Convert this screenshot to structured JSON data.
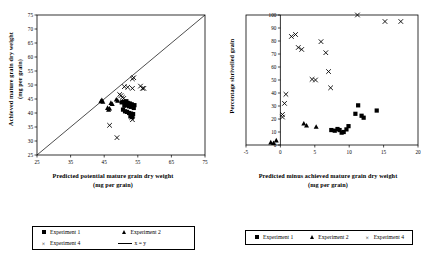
{
  "figure": {
    "background": "#ffffff",
    "ink": "#000000"
  },
  "panels": [
    {
      "id": "left",
      "xlabel_line1": "Predicted potential mature grain dry weight",
      "xlabel_line2": "(mg per grain)",
      "ylabel_line1": "Achieved mature grain dry weight",
      "ylabel_line2": "(mg per grain)",
      "xticks": [
        25,
        35,
        45,
        55,
        65,
        75
      ],
      "yticks": [
        25,
        30,
        35,
        40,
        45,
        50,
        55,
        60,
        65,
        70,
        75
      ],
      "xlim": [
        25,
        75
      ],
      "ylim": [
        25,
        75
      ]
    },
    {
      "id": "right",
      "xlabel_line1": "Predicted minus achieved mature grain dry weight",
      "xlabel_line2": "(mg per grain)",
      "ylabel_line1": "Percentage shrivelled grain",
      "xticks": [
        -5,
        0,
        5,
        10,
        15,
        20
      ],
      "yticks": [
        0,
        10,
        20,
        30,
        40,
        50,
        60,
        70,
        80,
        90,
        100
      ],
      "xlim": [
        -5,
        20
      ],
      "ylim": [
        0,
        100
      ]
    }
  ],
  "legends": {
    "left": {
      "entries": [
        {
          "label": "Experiment 1",
          "marker": "square"
        },
        {
          "label": "Experiment 2",
          "marker": "triangle"
        },
        {
          "label": "Experiment 4",
          "marker": "cross",
          "glyph": "×"
        },
        {
          "label": "x = y",
          "marker": "line"
        }
      ]
    },
    "right": {
      "entries": [
        {
          "label": "Experiment 1",
          "marker": "square"
        },
        {
          "label": "Experiment 2",
          "marker": "triangle"
        },
        {
          "label": "Experiment 4",
          "marker": "cross",
          "glyph": "×"
        }
      ]
    }
  },
  "chart_data": [
    {
      "type": "scatter",
      "panel": "left",
      "title": "",
      "xlabel": "Predicted potential mature grain dry weight (mg per grain)",
      "ylabel": "Achieved mature grain dry weight (mg per grain)",
      "xlim": [
        25,
        75
      ],
      "ylim": [
        25,
        75
      ],
      "xticks": [
        25,
        35,
        45,
        55,
        65,
        75
      ],
      "yticks": [
        25,
        30,
        35,
        40,
        45,
        50,
        55,
        60,
        65,
        70,
        75
      ],
      "grid": false,
      "legend_position": "below-figure",
      "reference_line": {
        "name": "x = y",
        "from": [
          25,
          25
        ],
        "to": [
          75,
          75
        ]
      },
      "series": [
        {
          "name": "Experiment 1",
          "marker": "square",
          "points": [
            [
              51.6,
              44.2
            ],
            [
              52.0,
              43.6
            ],
            [
              52.3,
              43.2
            ],
            [
              52.6,
              43.4
            ],
            [
              52.9,
              42.9
            ],
            [
              53.2,
              43.1
            ],
            [
              53.4,
              42.6
            ],
            [
              53.0,
              42.2
            ],
            [
              52.4,
              42.4
            ],
            [
              51.9,
              42.8
            ],
            [
              51.4,
              43.0
            ],
            [
              51.0,
              42.6
            ],
            [
              50.6,
              41.2
            ],
            [
              51.2,
              40.6
            ],
            [
              51.8,
              40.4
            ],
            [
              52.4,
              40.0
            ],
            [
              53.0,
              39.8
            ],
            [
              53.6,
              39.6
            ],
            [
              52.8,
              38.8
            ],
            [
              53.4,
              38.6
            ],
            [
              50.2,
              43.8
            ],
            [
              54.0,
              42.8
            ],
            [
              53.8,
              41.8
            ],
            [
              50.8,
              44.0
            ]
          ]
        },
        {
          "name": "Experiment 2",
          "marker": "triangle",
          "points": [
            [
              44.0,
              44.2
            ],
            [
              44.3,
              44.6
            ],
            [
              44.6,
              44.0
            ],
            [
              46.0,
              41.8
            ],
            [
              46.3,
              41.2
            ],
            [
              46.6,
              41.6
            ],
            [
              48.6,
              44.8
            ],
            [
              49.0,
              44.4
            ],
            [
              47.4,
              43.2
            ],
            [
              47.0,
              43.6
            ]
          ]
        },
        {
          "name": "Experiment 4",
          "marker": "cross",
          "points": [
            [
              53.8,
              52.6
            ],
            [
              53.4,
              52.2
            ],
            [
              51.0,
              49.4
            ],
            [
              52.0,
              49.2
            ],
            [
              53.4,
              48.8
            ],
            [
              55.8,
              49.6
            ],
            [
              56.4,
              48.8
            ],
            [
              56.8,
              48.8
            ],
            [
              49.6,
              46.6
            ],
            [
              50.0,
              46.2
            ],
            [
              50.4,
              45.6
            ],
            [
              50.8,
              45.2
            ],
            [
              53.2,
              38.4
            ],
            [
              53.4,
              37.6
            ],
            [
              46.6,
              35.6
            ],
            [
              48.8,
              31.2
            ]
          ]
        }
      ]
    },
    {
      "type": "scatter",
      "panel": "right",
      "title": "",
      "xlabel": "Predicted minus achieved mature grain dry weight (mg per grain)",
      "ylabel": "Percentage shrivelled grain",
      "xlim": [
        -5,
        20
      ],
      "ylim": [
        0,
        100
      ],
      "xticks": [
        -5,
        0,
        5,
        10,
        15,
        20
      ],
      "yticks": [
        0,
        10,
        20,
        30,
        40,
        50,
        60,
        70,
        80,
        90,
        100
      ],
      "grid": false,
      "legend_position": "below-figure",
      "series": [
        {
          "name": "Experiment 1",
          "marker": "square",
          "points": [
            [
              7.4,
              11.5
            ],
            [
              7.9,
              11.0
            ],
            [
              8.3,
              12.3
            ],
            [
              8.6,
              11.5
            ],
            [
              8.9,
              9.5
            ],
            [
              9.2,
              10.0
            ],
            [
              9.6,
              12.0
            ],
            [
              9.9,
              14.5
            ],
            [
              10.9,
              24.0
            ],
            [
              11.3,
              30.5
            ],
            [
              11.8,
              22.5
            ],
            [
              12.1,
              21.0
            ],
            [
              14.0,
              26.5
            ]
          ]
        },
        {
          "name": "Experiment 2",
          "marker": "triangle",
          "points": [
            [
              -1.4,
              2.0
            ],
            [
              -1.0,
              1.5
            ],
            [
              -0.6,
              3.5
            ],
            [
              3.4,
              16.5
            ],
            [
              3.8,
              15.0
            ],
            [
              5.2,
              14.0
            ]
          ]
        },
        {
          "name": "Experiment 4",
          "marker": "cross",
          "points": [
            [
              0.6,
              32.0
            ],
            [
              0.8,
              39.0
            ],
            [
              0.3,
              21.5
            ],
            [
              0.3,
              23.5
            ],
            [
              1.6,
              83.5
            ],
            [
              2.2,
              85.0
            ],
            [
              2.6,
              75.0
            ],
            [
              3.1,
              73.5
            ],
            [
              4.6,
              50.5
            ],
            [
              5.1,
              50.0
            ],
            [
              5.9,
              79.5
            ],
            [
              6.6,
              71.0
            ],
            [
              7.0,
              56.5
            ],
            [
              7.3,
              44.0
            ],
            [
              11.2,
              100.0
            ],
            [
              15.2,
              95.0
            ],
            [
              17.5,
              95.0
            ]
          ]
        }
      ]
    }
  ]
}
